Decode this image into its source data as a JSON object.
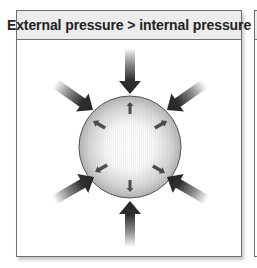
{
  "panel": {
    "title": "External pressure > internal pressure"
  },
  "diagram": {
    "external_arrows": {
      "count": 8,
      "direction": "inward",
      "angles_deg": [
        270,
        315,
        0,
        45,
        90,
        135,
        180,
        225
      ],
      "color": "#2e2e2e"
    },
    "internal_arrows": {
      "count": 8,
      "direction": "outward",
      "size": "small",
      "color": "#333333"
    },
    "sphere_colors": {
      "center": "#ffffff",
      "edge": "#b8b8b8",
      "outline": "#555555"
    }
  },
  "adjacent_panel": {
    "visible": "partial-edge"
  }
}
